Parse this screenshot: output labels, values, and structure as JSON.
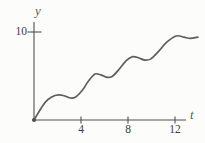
{
  "figure": {
    "background": "#fcfcfa"
  },
  "chart_data": {
    "type": "line",
    "title": "",
    "xlabel": "t",
    "ylabel": "y",
    "xlim": [
      0,
      13.2
    ],
    "ylim": [
      0,
      11.2
    ],
    "grid": false,
    "legend": null,
    "x_axis": {
      "ticks": [
        {
          "value": 4,
          "label": "4"
        },
        {
          "value": 8,
          "label": "8"
        },
        {
          "value": 12,
          "label": "12"
        }
      ]
    },
    "y_axis": {
      "ticks": [
        {
          "value": 10,
          "label": "10"
        }
      ]
    },
    "origin_marker": true,
    "series": [
      {
        "name": "curve",
        "color": "#5e5e5e",
        "points": [
          [
            0,
            0
          ],
          [
            0.45,
            1.0
          ],
          [
            0.95,
            2.0
          ],
          [
            1.5,
            2.62
          ],
          [
            2.1,
            2.85
          ],
          [
            2.65,
            2.72
          ],
          [
            3.1,
            2.5
          ],
          [
            3.55,
            2.62
          ],
          [
            4.1,
            3.35
          ],
          [
            4.65,
            4.45
          ],
          [
            5.2,
            5.22
          ],
          [
            5.7,
            5.12
          ],
          [
            6.2,
            4.85
          ],
          [
            6.65,
            4.95
          ],
          [
            7.2,
            5.7
          ],
          [
            7.85,
            6.75
          ],
          [
            8.4,
            7.2
          ],
          [
            8.9,
            7.06
          ],
          [
            9.45,
            6.8
          ],
          [
            9.95,
            6.95
          ],
          [
            10.6,
            7.8
          ],
          [
            11.3,
            8.85
          ],
          [
            12.1,
            9.55
          ],
          [
            12.75,
            9.42
          ],
          [
            13.3,
            9.27
          ],
          [
            13.95,
            9.42
          ]
        ]
      }
    ],
    "colors": {
      "axis": "#4f4f4f",
      "tick_text": "#3d3d3d",
      "axis_label_text": "#5a5a5a",
      "curve": "#5e5e5e"
    }
  }
}
